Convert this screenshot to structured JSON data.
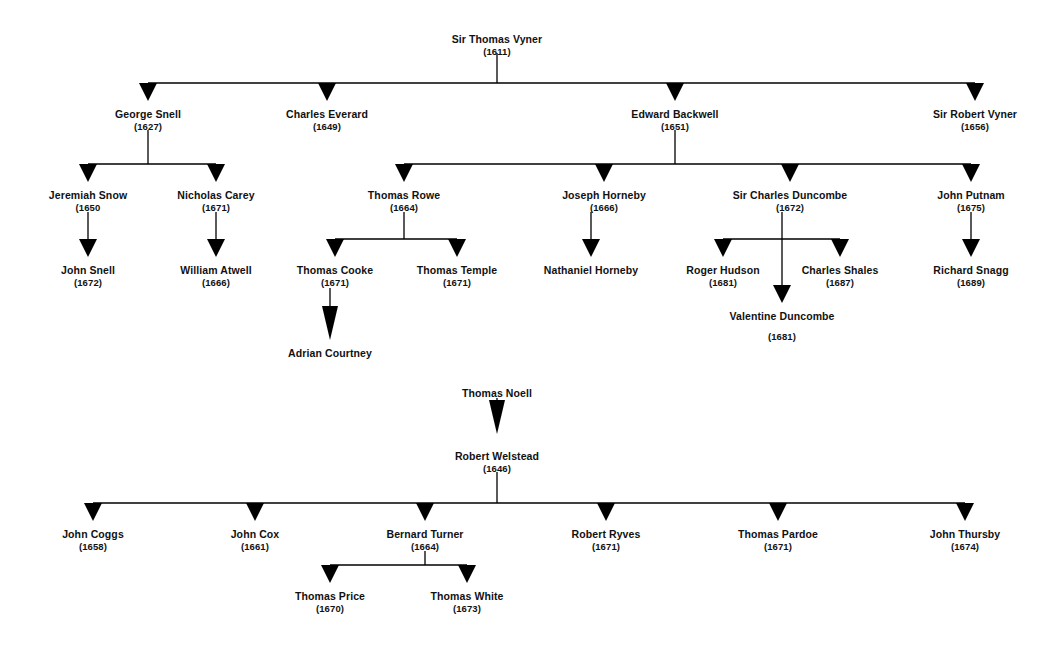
{
  "diagram": {
    "type": "lineage-tree",
    "line_color": "#000000",
    "text_color": "#111111",
    "background": "#ffffff",
    "arrow_style": "solid-triangle-downward"
  },
  "trees": [
    {
      "id": "vyner-tree",
      "root": "Sir Thomas Vyner",
      "nodes": [
        {
          "id": "n1",
          "name": "Sir Thomas Vyner",
          "year": "(1611)",
          "x": 497,
          "y": 34,
          "nameY": 34,
          "yearY": 47
        },
        {
          "id": "n2",
          "name": "George Snell",
          "year": "(1627)",
          "x": 148,
          "y": 109,
          "nameY": 109,
          "yearY": 122
        },
        {
          "id": "n3",
          "name": "Charles Everard",
          "year": "(1649)",
          "x": 327,
          "y": 109,
          "nameY": 109,
          "yearY": 122
        },
        {
          "id": "n4",
          "name": "Edward Backwell",
          "year": "(1651)",
          "x": 675,
          "y": 109,
          "nameY": 109,
          "yearY": 122
        },
        {
          "id": "n5",
          "name": "Sir Robert Vyner",
          "year": "(1656)",
          "x": 975,
          "y": 109,
          "nameY": 109,
          "yearY": 122
        },
        {
          "id": "n6",
          "name": "Jeremiah Snow",
          "year": "(1650",
          "x": 88,
          "y": 190,
          "nameY": 190,
          "yearY": 203
        },
        {
          "id": "n7",
          "name": "Nicholas Carey",
          "year": "(1671)",
          "x": 216,
          "y": 190,
          "nameY": 190,
          "yearY": 203
        },
        {
          "id": "n8",
          "name": "Thomas Rowe",
          "year": "(1664)",
          "x": 404,
          "y": 190,
          "nameY": 190,
          "yearY": 203
        },
        {
          "id": "n9",
          "name": "Joseph Horneby",
          "year": "(1666)",
          "x": 604,
          "y": 190,
          "nameY": 190,
          "yearY": 203
        },
        {
          "id": "n10",
          "name": "Sir Charles Duncombe",
          "year": "(1672)",
          "x": 790,
          "y": 190,
          "nameY": 190,
          "yearY": 203
        },
        {
          "id": "n11",
          "name": "John Putnam",
          "year": "(1675)",
          "x": 971,
          "y": 190,
          "nameY": 190,
          "yearY": 203
        },
        {
          "id": "n12",
          "name": "John Snell",
          "year": "(1672)",
          "x": 88,
          "y": 265,
          "nameY": 265,
          "yearY": 278
        },
        {
          "id": "n13",
          "name": "William Atwell",
          "year": "(1666)",
          "x": 216,
          "y": 265,
          "nameY": 265,
          "yearY": 278
        },
        {
          "id": "n14",
          "name": "Thomas Cooke",
          "year": "(1671)",
          "x": 335,
          "y": 265,
          "nameY": 265,
          "yearY": 278
        },
        {
          "id": "n15",
          "name": "Thomas Temple",
          "year": "(1671)",
          "x": 457,
          "y": 265,
          "nameY": 265,
          "yearY": 278
        },
        {
          "id": "n16",
          "name": "Nathaniel Horneby",
          "year": "",
          "x": 591,
          "y": 265,
          "nameY": 265,
          "yearY": 278
        },
        {
          "id": "n17",
          "name": "Roger Hudson",
          "year": "(1681)",
          "x": 723,
          "y": 265,
          "nameY": 265,
          "yearY": 278
        },
        {
          "id": "n18",
          "name": "Charles Shales",
          "year": "(1687)",
          "x": 840,
          "y": 265,
          "nameY": 265,
          "yearY": 278
        },
        {
          "id": "n19",
          "name": "Richard Snagg",
          "year": "(1689)",
          "x": 971,
          "y": 265,
          "nameY": 265,
          "yearY": 278
        },
        {
          "id": "n20",
          "name": "Valentine Duncombe",
          "year": "(1681)",
          "x": 782,
          "y": 311,
          "nameY": 311,
          "yearY": 332
        },
        {
          "id": "n21",
          "name": "Adrian Courtney",
          "year": "",
          "x": 330,
          "y": 348,
          "nameY": 348,
          "yearY": 361
        }
      ],
      "edges": [
        {
          "from": "n1",
          "to": [
            "n2",
            "n3",
            "n4",
            "n5"
          ]
        },
        {
          "from": "n2",
          "to": [
            "n6",
            "n7"
          ]
        },
        {
          "from": "n4",
          "to": [
            "n8",
            "n9",
            "n10",
            "n11"
          ]
        },
        {
          "from": "n6",
          "to": [
            "n12"
          ]
        },
        {
          "from": "n7",
          "to": [
            "n13"
          ]
        },
        {
          "from": "n8",
          "to": [
            "n14",
            "n15"
          ]
        },
        {
          "from": "n9",
          "to": [
            "n16"
          ]
        },
        {
          "from": "n10",
          "to": [
            "n17",
            "n18",
            "n20"
          ]
        },
        {
          "from": "n11",
          "to": [
            "n19"
          ]
        },
        {
          "from": "n14",
          "to": [
            "n21"
          ]
        }
      ]
    },
    {
      "id": "noell-tree",
      "root": "Thomas Noell",
      "nodes": [
        {
          "id": "m1",
          "name": "Thomas Noell",
          "year": "",
          "x": 497,
          "y": 388,
          "nameY": 388,
          "yearY": 401
        },
        {
          "id": "m2",
          "name": "Robert Welstead",
          "year": "(1646)",
          "x": 497,
          "y": 451,
          "nameY": 451,
          "yearY": 464
        },
        {
          "id": "m3",
          "name": "John Coggs",
          "year": "(1658)",
          "x": 93,
          "y": 529,
          "nameY": 529,
          "yearY": 542
        },
        {
          "id": "m4",
          "name": "John Cox",
          "year": "(1661)",
          "x": 255,
          "y": 529,
          "nameY": 529,
          "yearY": 542
        },
        {
          "id": "m5",
          "name": "Bernard Turner",
          "year": "(1664)",
          "x": 425,
          "y": 529,
          "nameY": 529,
          "yearY": 542
        },
        {
          "id": "m6",
          "name": "Robert Ryves",
          "year": "(1671)",
          "x": 606,
          "y": 529,
          "nameY": 529,
          "yearY": 542
        },
        {
          "id": "m7",
          "name": "Thomas Pardoe",
          "year": "(1671)",
          "x": 778,
          "y": 529,
          "nameY": 529,
          "yearY": 542
        },
        {
          "id": "m8",
          "name": "John Thursby",
          "year": "(1674)",
          "x": 965,
          "y": 529,
          "nameY": 529,
          "yearY": 542
        },
        {
          "id": "m9",
          "name": "Thomas Price",
          "year": "(1670)",
          "x": 330,
          "y": 591,
          "nameY": 591,
          "yearY": 604
        },
        {
          "id": "m10",
          "name": "Thomas White",
          "year": "(1673)",
          "x": 467,
          "y": 591,
          "nameY": 591,
          "yearY": 604
        }
      ],
      "edges": [
        {
          "from": "m1",
          "to": [
            "m2"
          ]
        },
        {
          "from": "m2",
          "to": [
            "m3",
            "m4",
            "m5",
            "m6",
            "m7",
            "m8"
          ]
        },
        {
          "from": "m5",
          "to": [
            "m9",
            "m10"
          ]
        }
      ]
    }
  ]
}
